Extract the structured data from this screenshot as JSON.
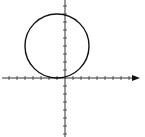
{
  "chart_data": {
    "type": "diagram",
    "title": "",
    "axes": {
      "x": {
        "min": -8,
        "max": 9,
        "arrow": "right",
        "tick_spacing": 1,
        "labels": []
      },
      "y": {
        "min": -7,
        "max": 10,
        "arrow": "none",
        "tick_spacing": 1,
        "labels": []
      },
      "grid": false
    },
    "shapes": [
      {
        "type": "circle",
        "center": [
          -1,
          4
        ],
        "radius": 4
      }
    ]
  },
  "layout": {
    "origin_px": [
      65,
      78
    ],
    "unit_px": 8,
    "x_axis": {
      "x1": 2,
      "x2": 140
    },
    "y_axis": {
      "y1": 0,
      "y2": 137
    },
    "stroke_color": "#111111",
    "axis_color": "#333333",
    "tick_half": 2
  }
}
